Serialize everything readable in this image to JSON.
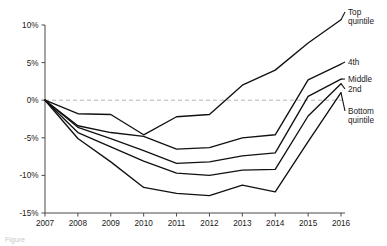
{
  "caption": "Figure",
  "colors": {
    "line": "#111111",
    "axis": "#4a4a4a",
    "zero_line": "#b5b5b5",
    "background": "#ffffff",
    "text": "#1a1a1a"
  },
  "chart_data": {
    "type": "line",
    "title": "",
    "subtitle": "",
    "xlabel": "",
    "ylabel": "",
    "x": [
      2007,
      2008,
      2009,
      2010,
      2011,
      2012,
      2013,
      2014,
      2015,
      2016
    ],
    "categories": [
      "2007",
      "2008",
      "2009",
      "2010",
      "2011",
      "2012",
      "2013",
      "2014",
      "2015",
      "2016"
    ],
    "xlim": [
      2007,
      2016
    ],
    "ylim": [
      -15,
      10
    ],
    "y_ticks": [
      10,
      5,
      0,
      -5,
      -10,
      -15
    ],
    "y_tick_labels": [
      "10%",
      "5%",
      "0%",
      "-5%",
      "-10%",
      "-15%"
    ],
    "x_ticks": [
      2007,
      2008,
      2009,
      2010,
      2011,
      2012,
      2013,
      2014,
      2015,
      2016
    ],
    "x_tick_labels": [
      "2007",
      "2008",
      "2009",
      "2010",
      "2011",
      "2012",
      "2013",
      "2014",
      "2015",
      "2016"
    ],
    "grid": false,
    "legend_position": "right-inline-labels",
    "annotations": [
      {
        "label": "zero reference line",
        "y": 0,
        "style": "dashed"
      }
    ],
    "series": [
      {
        "name": "Top quintile",
        "label": "Top\nquintile",
        "label_line1": "Top",
        "label_line2": "quintile",
        "values": [
          0,
          -1.8,
          -1.9,
          -4.6,
          -2.2,
          -1.9,
          2.0,
          4.0,
          7.6,
          10.7
        ]
      },
      {
        "name": "4th",
        "label": "4th",
        "label_line1": "4th",
        "label_line2": "",
        "values": [
          0,
          -3.4,
          -4.3,
          -4.8,
          -6.5,
          -6.3,
          -5.0,
          -4.6,
          2.7,
          4.8
        ]
      },
      {
        "name": "Middle",
        "label": "Middle",
        "label_line1": "Middle",
        "label_line2": "",
        "values": [
          0,
          -3.6,
          -5.1,
          -6.7,
          -8.4,
          -8.2,
          -7.4,
          -7.0,
          0.5,
          2.8
        ]
      },
      {
        "name": "2nd",
        "label": "2nd",
        "label_line1": "2nd",
        "label_line2": "",
        "values": [
          0,
          -4.3,
          -6.2,
          -8.1,
          -9.7,
          -10.0,
          -9.3,
          -9.2,
          -2.1,
          2.2
        ]
      },
      {
        "name": "Bottom quintile",
        "label": "Bottom\nquintile",
        "label_line1": "Bottom",
        "label_line2": "quintile",
        "values": [
          0,
          -5.1,
          -8.2,
          -11.6,
          -12.4,
          -12.7,
          -11.3,
          -12.2,
          -5.5,
          1.0
        ]
      }
    ]
  }
}
